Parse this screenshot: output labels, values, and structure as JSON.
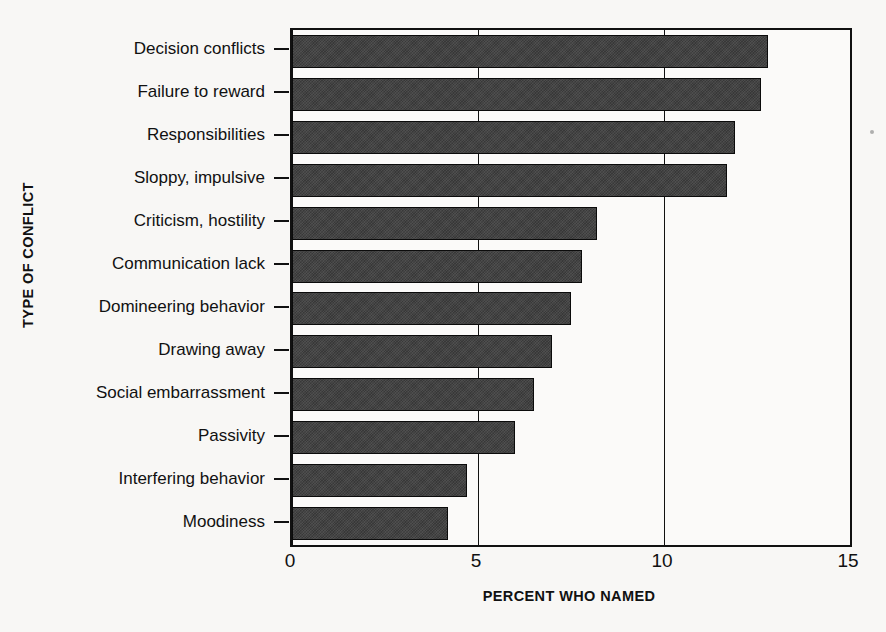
{
  "chart_data": {
    "type": "bar",
    "orientation": "horizontal",
    "title": "",
    "xlabel": "PERCENT WHO NAMED",
    "ylabel": "TYPE OF CONFLICT",
    "xlim": [
      0,
      15
    ],
    "xticks": [
      "0",
      "5",
      "10",
      "15"
    ],
    "xtick_values": [
      0,
      5,
      10,
      15
    ],
    "grid": "vertical gridlines at x = 5 and x = 10",
    "legend": "none",
    "bar_color": "#3d3d3d",
    "bar_edge_color": "#0b0b0b",
    "axis_color": "#111111",
    "background_color": "#f8f7f5",
    "categories": [
      "Decision conflicts",
      "Failure to reward",
      "Responsibilities",
      "Sloppy, impulsive",
      "Criticism, hostility",
      "Communication lack",
      "Domineering behavior",
      "Drawing away",
      "Social embarrassment",
      "Passivity",
      "Interfering behavior",
      "Moodiness"
    ],
    "values": [
      12.8,
      12.6,
      11.9,
      11.7,
      8.2,
      7.8,
      7.5,
      7.0,
      6.5,
      6.0,
      4.7,
      4.2
    ]
  }
}
